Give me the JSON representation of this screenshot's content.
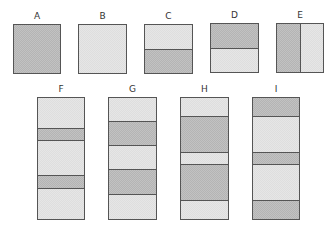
{
  "figures": [
    {
      "label": "A",
      "x": 13,
      "y": 24,
      "w": 48,
      "h": 50,
      "orient": "h",
      "segments": [
        {
          "frac": 1,
          "shade": "dark"
        }
      ]
    },
    {
      "label": "B",
      "x": 78,
      "y": 24,
      "w": 49,
      "h": 50,
      "orient": "h",
      "segments": [
        {
          "frac": 1,
          "shade": "light"
        }
      ]
    },
    {
      "label": "C",
      "x": 144,
      "y": 24,
      "w": 49,
      "h": 50,
      "orient": "h",
      "segments": [
        {
          "frac": 0.5,
          "shade": "light"
        },
        {
          "frac": 0.5,
          "shade": "dark"
        }
      ]
    },
    {
      "label": "D",
      "x": 210,
      "y": 23,
      "w": 49,
      "h": 50,
      "orient": "h",
      "segments": [
        {
          "frac": 0.5,
          "shade": "dark"
        },
        {
          "frac": 0.5,
          "shade": "light"
        }
      ]
    },
    {
      "label": "E",
      "x": 276,
      "y": 23,
      "w": 48,
      "h": 50,
      "orient": "v",
      "segments": [
        {
          "frac": 0.5,
          "shade": "dark"
        },
        {
          "frac": 0.5,
          "shade": "light"
        }
      ]
    },
    {
      "label": "F",
      "x": 37,
      "y": 97,
      "w": 48,
      "h": 123,
      "orient": "h",
      "segments": [
        {
          "frac": 0.245,
          "shade": "light"
        },
        {
          "frac": 0.105,
          "shade": "dark"
        },
        {
          "frac": 0.29,
          "shade": "light"
        },
        {
          "frac": 0.105,
          "shade": "dark"
        },
        {
          "frac": 0.255,
          "shade": "light"
        }
      ]
    },
    {
      "label": "G",
      "x": 108,
      "y": 97,
      "w": 49,
      "h": 123,
      "orient": "h",
      "segments": [
        {
          "frac": 0.19,
          "shade": "light"
        },
        {
          "frac": 0.2,
          "shade": "dark"
        },
        {
          "frac": 0.2,
          "shade": "light"
        },
        {
          "frac": 0.2,
          "shade": "dark"
        },
        {
          "frac": 0.21,
          "shade": "light"
        }
      ]
    },
    {
      "label": "H",
      "x": 180,
      "y": 97,
      "w": 49,
      "h": 123,
      "orient": "h",
      "segments": [
        {
          "frac": 0.145,
          "shade": "light"
        },
        {
          "frac": 0.3,
          "shade": "dark"
        },
        {
          "frac": 0.1,
          "shade": "light"
        },
        {
          "frac": 0.3,
          "shade": "dark"
        },
        {
          "frac": 0.155,
          "shade": "light"
        }
      ]
    },
    {
      "label": "I",
      "x": 252,
      "y": 97,
      "w": 48,
      "h": 123,
      "orient": "h",
      "segments": [
        {
          "frac": 0.145,
          "shade": "dark"
        },
        {
          "frac": 0.3,
          "shade": "light"
        },
        {
          "frac": 0.1,
          "shade": "dark"
        },
        {
          "frac": 0.3,
          "shade": "light"
        },
        {
          "frac": 0.155,
          "shade": "dark"
        }
      ]
    }
  ]
}
